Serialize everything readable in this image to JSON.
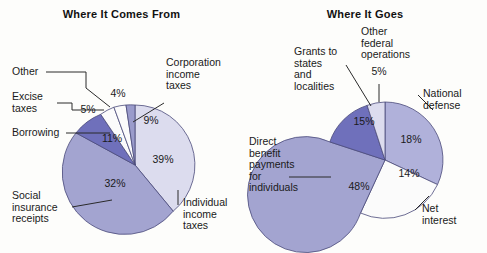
{
  "figure": {
    "background": "#fdfdfb",
    "leader_line_color": "#2a2a2a"
  },
  "chart_data": [
    {
      "type": "pie",
      "title": "Where It Comes From",
      "id": "where-it-comes-from",
      "unit": "percent",
      "legend": "none (direct callout labels)",
      "start_angle_deg": -90,
      "direction": "clockwise",
      "categories": [
        "Corporation income taxes",
        "Individual income taxes",
        "Social insurance receipts",
        "Borrowing",
        "Excise taxes",
        "Other"
      ],
      "values": [
        9,
        39,
        32,
        11,
        5,
        4
      ],
      "labels": [
        "9%",
        "39%",
        "32%",
        "11%",
        "5%",
        "4%"
      ],
      "colors": [
        "#9a9bcb",
        "#dcdcee",
        "#a3a4d0",
        "#6f70bb",
        "#fbfbfb",
        "#fbfbfb"
      ]
    },
    {
      "type": "pie",
      "title": "Where It Goes",
      "id": "where-it-goes",
      "unit": "percent",
      "legend": "none (direct callout labels)",
      "start_angle_deg": -90,
      "direction": "clockwise",
      "categories": [
        "National defense",
        "Net interest",
        "Direct benefit payments for individuals",
        "Grants to states and localities",
        "Other federal operations"
      ],
      "values": [
        18,
        14,
        48,
        15,
        5
      ],
      "labels": [
        "18%",
        "14%",
        "48%",
        "15%",
        "5%"
      ],
      "colors": [
        "#b0b1da",
        "#fbfbfb",
        "#a3a4d0",
        "#6f70bb",
        "#dcdcee"
      ]
    }
  ],
  "left_chart": {
    "title": "Where It Comes From",
    "callouts": {
      "other": "Other",
      "excise_taxes": "Excise\ntaxes",
      "borrowing": "Borrowing",
      "social_insurance": "Social\ninsurance\nreceipts",
      "corporation": "Corporation\nincome\ntaxes",
      "individual": "Individual\nincome\ntaxes"
    },
    "slice_labels": {
      "other": "4%",
      "excise_taxes": "5%",
      "corporation": "9%",
      "borrowing": "11%",
      "social_insurance": "32%",
      "individual": "39%"
    }
  },
  "right_chart": {
    "title": "Where It Goes",
    "callouts": {
      "grants": "Grants to\nstates\nand\nlocalities",
      "other_federal": "Other\nfederal\noperations",
      "national_defense": "National\ndefense",
      "net_interest": "Net\ninterest",
      "direct_benefit": "Direct\nbenefit\npayments\nfor\nindividuals"
    },
    "slice_labels": {
      "other_federal": "5%",
      "grants": "15%",
      "national_defense": "18%",
      "net_interest": "14%",
      "direct_benefit": "48%"
    }
  }
}
